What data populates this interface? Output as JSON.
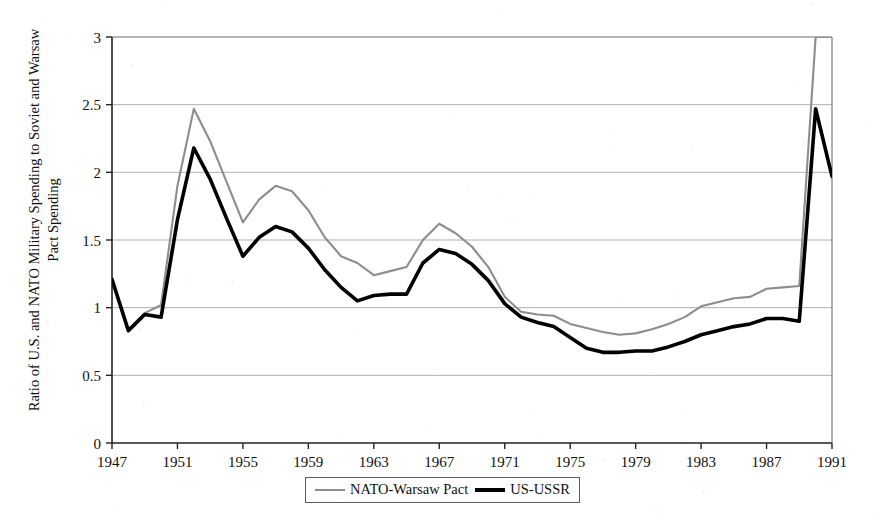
{
  "chart_data": {
    "type": "line",
    "title": "",
    "xlabel": "",
    "ylabel": "Ratio of U.S. and NATO Military Spending to Soviet and Warsaw Pact Spending",
    "xlim": [
      1947,
      1991
    ],
    "ylim": [
      0,
      3
    ],
    "xticks": [
      1947,
      1951,
      1955,
      1959,
      1963,
      1967,
      1971,
      1975,
      1979,
      1983,
      1987,
      1991
    ],
    "xtick_labels": [
      "1947",
      "1951",
      "1955",
      "1959",
      "1963",
      "1967",
      "1971",
      "1975",
      "1979",
      "1983",
      "1987",
      "1991"
    ],
    "yticks": [
      0,
      0.5,
      1,
      1.5,
      2,
      2.5,
      3
    ],
    "ytick_labels": [
      "0",
      "0.5",
      "1",
      "1.5",
      "2",
      "2.5",
      "3"
    ],
    "grid": true,
    "grid_axis": "y",
    "legend_position": "bottom-center",
    "x": [
      1947,
      1948,
      1949,
      1950,
      1951,
      1952,
      1953,
      1954,
      1955,
      1956,
      1957,
      1958,
      1959,
      1960,
      1961,
      1962,
      1963,
      1964,
      1965,
      1966,
      1967,
      1968,
      1969,
      1970,
      1971,
      1972,
      1973,
      1974,
      1975,
      1976,
      1977,
      1978,
      1979,
      1980,
      1981,
      1982,
      1983,
      1984,
      1985,
      1986,
      1987,
      1988,
      1989,
      1990,
      1991
    ],
    "series": [
      {
        "name": "NATO-Warsaw Pact",
        "color": "#8d8d8d",
        "style": "thin-gray",
        "clipped_at_top": true,
        "values": [
          1.21,
          0.84,
          0.96,
          1.02,
          1.9,
          2.47,
          2.23,
          1.93,
          1.63,
          1.8,
          1.9,
          1.86,
          1.72,
          1.52,
          1.38,
          1.33,
          1.24,
          1.27,
          1.3,
          1.5,
          1.62,
          1.55,
          1.45,
          1.3,
          1.08,
          0.97,
          0.95,
          0.94,
          0.88,
          0.85,
          0.82,
          0.8,
          0.81,
          0.84,
          0.88,
          0.93,
          1.01,
          1.04,
          1.07,
          1.08,
          1.14,
          1.15,
          1.16,
          3.0,
          3.0
        ]
      },
      {
        "name": "US-USSR",
        "color": "#000000",
        "style": "thick-black",
        "clipped_at_top": false,
        "values": [
          1.21,
          0.83,
          0.95,
          0.93,
          1.65,
          2.18,
          1.95,
          1.66,
          1.38,
          1.52,
          1.6,
          1.56,
          1.44,
          1.28,
          1.15,
          1.05,
          1.09,
          1.1,
          1.1,
          1.33,
          1.43,
          1.4,
          1.32,
          1.2,
          1.03,
          0.93,
          0.89,
          0.86,
          0.78,
          0.7,
          0.67,
          0.67,
          0.68,
          0.68,
          0.71,
          0.75,
          0.8,
          0.83,
          0.86,
          0.88,
          0.92,
          0.92,
          0.9,
          2.47,
          1.97
        ]
      }
    ]
  },
  "legend": {
    "items": [
      {
        "label": "NATO-Warsaw Pact"
      },
      {
        "label": "US-USSR"
      }
    ]
  }
}
